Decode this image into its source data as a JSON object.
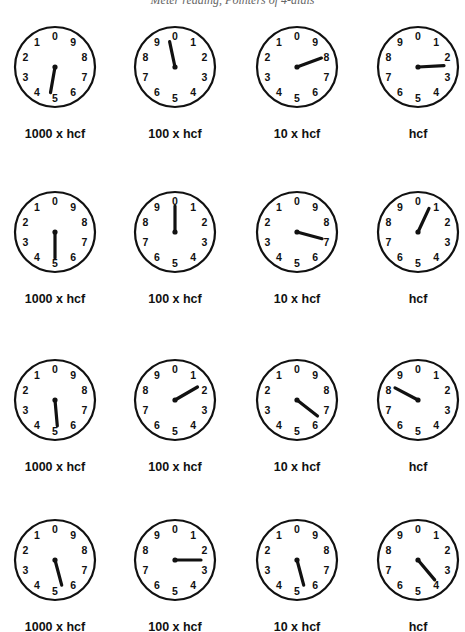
{
  "heading": "Meter reading, Pointers of 4-dials",
  "labels": [
    "1000 x hcf",
    "100 x hcf",
    "10 x hcf",
    "hcf"
  ],
  "dial_faces": {
    "ccw": [
      "0",
      "9",
      "8",
      "7",
      "6",
      "5",
      "4",
      "3",
      "2",
      "1"
    ],
    "cw": [
      "0",
      "1",
      "2",
      "3",
      "4",
      "5",
      "6",
      "7",
      "8",
      "9"
    ]
  },
  "rows": [
    {
      "dials": [
        {
          "label": "1000 x hcf",
          "direction": "ccw",
          "hand_angle": 190
        },
        {
          "label": "100 x hcf",
          "direction": "cw",
          "hand_angle": 348
        },
        {
          "label": "10 x hcf",
          "direction": "ccw",
          "hand_angle": 70
        },
        {
          "label": "hcf",
          "direction": "cw",
          "hand_angle": 87
        }
      ]
    },
    {
      "dials": [
        {
          "label": "1000 x hcf",
          "direction": "ccw",
          "hand_angle": 180
        },
        {
          "label": "100 x hcf",
          "direction": "cw",
          "hand_angle": 0
        },
        {
          "label": "10 x hcf",
          "direction": "ccw",
          "hand_angle": 105
        },
        {
          "label": "hcf",
          "direction": "cw",
          "hand_angle": 25
        }
      ]
    },
    {
      "dials": [
        {
          "label": "1000 x hcf",
          "direction": "ccw",
          "hand_angle": 175
        },
        {
          "label": "100 x hcf",
          "direction": "cw",
          "hand_angle": 60
        },
        {
          "label": "10 x hcf",
          "direction": "ccw",
          "hand_angle": 128
        },
        {
          "label": "hcf",
          "direction": "cw",
          "hand_angle": 298
        }
      ]
    },
    {
      "dials": [
        {
          "label": "1000 x hcf",
          "direction": "ccw",
          "hand_angle": 165
        },
        {
          "label": "100 x hcf",
          "direction": "cw",
          "hand_angle": 90
        },
        {
          "label": "10 x hcf",
          "direction": "ccw",
          "hand_angle": 165
        },
        {
          "label": "hcf",
          "direction": "cw",
          "hand_angle": 140
        }
      ]
    }
  ]
}
